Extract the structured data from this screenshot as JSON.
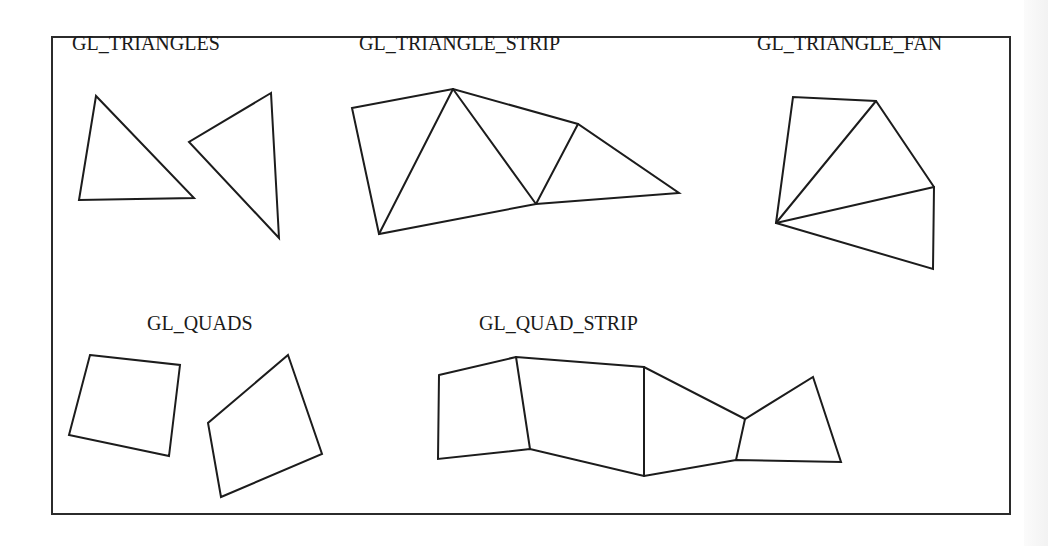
{
  "diagram": {
    "frame": {
      "x": 52,
      "y": 37,
      "width": 958,
      "height": 477
    },
    "colors": {
      "stroke": "#1c1c1c",
      "frame": "#2b2b2b",
      "background": "#ffffff",
      "outside": "#f4f4f4"
    },
    "labels": {
      "triangles": "GL_TRIANGLES",
      "triangle_strip": "GL_TRIANGLE_STRIP",
      "triangle_fan": "GL_TRIANGLE_FAN",
      "quads": "GL_QUADS",
      "quad_strip": "GL_QUAD_STRIP"
    },
    "label_positions": {
      "triangles": [
        72,
        50
      ],
      "triangle_strip": [
        359,
        50
      ],
      "triangle_fan": [
        757,
        50
      ],
      "quads": [
        147,
        330
      ],
      "quad_strip": [
        479,
        330
      ]
    },
    "primitives": {
      "triangles": [
        [
          [
            96,
            96
          ],
          [
            79,
            200
          ],
          [
            194,
            198
          ]
        ],
        [
          [
            271,
            93
          ],
          [
            189,
            142
          ],
          [
            279,
            238
          ]
        ]
      ],
      "triangle_strip": {
        "vertices": [
          [
            352,
            108
          ],
          [
            453,
            89
          ],
          [
            379,
            234
          ],
          [
            578,
            124
          ],
          [
            536,
            204
          ],
          [
            679,
            193
          ]
        ],
        "note": "actual draw order A,B,C,E,D,F forming connected triangles"
      },
      "triangle_fan": {
        "center": [
          776,
          223
        ],
        "rim": [
          [
            793,
            97
          ],
          [
            876,
            101
          ],
          [
            934,
            187
          ],
          [
            933,
            269
          ]
        ]
      },
      "quads": [
        [
          [
            90,
            355
          ],
          [
            180,
            365
          ],
          [
            169,
            456
          ],
          [
            69,
            435
          ]
        ],
        [
          [
            288,
            355
          ],
          [
            322,
            454
          ],
          [
            221,
            497
          ],
          [
            208,
            423
          ]
        ]
      ],
      "quad_strip": {
        "top": [
          [
            439,
            375
          ],
          [
            516,
            357
          ],
          [
            644,
            367
          ],
          [
            745,
            419
          ],
          [
            813,
            377
          ]
        ],
        "bottom": [
          [
            438,
            459
          ],
          [
            530,
            449
          ],
          [
            644,
            476
          ],
          [
            736,
            460
          ],
          [
            841,
            462
          ]
        ]
      }
    }
  }
}
